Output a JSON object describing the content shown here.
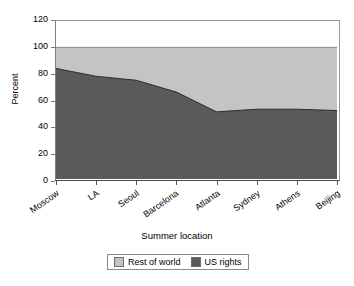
{
  "chart_data": {
    "type": "area",
    "stacked": true,
    "title": "",
    "xlabel": "Summer location",
    "ylabel": "Percent",
    "categories": [
      "Moscow",
      "LA",
      "Seoul",
      "Barcelona",
      "Atlanta",
      "Sydney",
      "Athens",
      "Beijing"
    ],
    "series": [
      {
        "name": "US rights",
        "values": [
          84,
          78,
          75,
          66,
          51,
          53,
          53,
          52
        ],
        "color": "#5a5a5a"
      },
      {
        "name": "Rest of world",
        "values": [
          16,
          22,
          25,
          34,
          49,
          47,
          47,
          48
        ],
        "color": "#c4c4c4"
      }
    ],
    "ylim": [
      0,
      120
    ],
    "yticks": [
      "0",
      "20",
      "40",
      "60",
      "80",
      "100",
      "120"
    ],
    "ytick_values": [
      0,
      20,
      40,
      60,
      80,
      100,
      120
    ],
    "grid": false,
    "legend_position": "bottom",
    "legend_entries": [
      "Rest of world",
      "US rights"
    ],
    "axis_color": "#808080",
    "plot_background": "#ffffff"
  },
  "legend": {
    "rest_of_world": "Rest of world",
    "us_rights": "US rights"
  },
  "axes": {
    "x_title": "Summer location",
    "y_title": "Percent"
  }
}
